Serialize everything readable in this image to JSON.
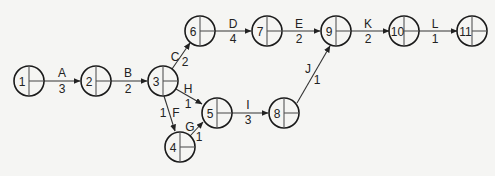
{
  "diagram": {
    "type": "activity-on-arrow network",
    "nodes": [
      {
        "id": "1",
        "label": "1",
        "x": 29,
        "y": 81
      },
      {
        "id": "2",
        "label": "2",
        "x": 96,
        "y": 81
      },
      {
        "id": "3",
        "label": "3",
        "x": 163,
        "y": 81
      },
      {
        "id": "4",
        "label": "4",
        "x": 180,
        "y": 147
      },
      {
        "id": "5",
        "label": "5",
        "x": 217,
        "y": 113
      },
      {
        "id": "6",
        "label": "6",
        "x": 200,
        "y": 31
      },
      {
        "id": "7",
        "label": "7",
        "x": 267,
        "y": 31
      },
      {
        "id": "8",
        "label": "8",
        "x": 284,
        "y": 113
      },
      {
        "id": "9",
        "label": "9",
        "x": 336,
        "y": 31
      },
      {
        "id": "10",
        "label": "10",
        "x": 404,
        "y": 31
      },
      {
        "id": "11",
        "label": "11",
        "x": 472,
        "y": 31
      }
    ],
    "edges": [
      {
        "from": "1",
        "to": "2",
        "activity": "A",
        "duration": "3"
      },
      {
        "from": "2",
        "to": "3",
        "activity": "B",
        "duration": "2"
      },
      {
        "from": "3",
        "to": "6",
        "activity": "C",
        "duration": "2"
      },
      {
        "from": "6",
        "to": "7",
        "activity": "D",
        "duration": "4"
      },
      {
        "from": "7",
        "to": "9",
        "activity": "E",
        "duration": "2"
      },
      {
        "from": "3",
        "to": "4",
        "activity": "F",
        "duration": "1"
      },
      {
        "from": "4",
        "to": "5",
        "activity": "G",
        "duration": "1"
      },
      {
        "from": "3",
        "to": "5",
        "activity": "H",
        "duration": "1"
      },
      {
        "from": "5",
        "to": "8",
        "activity": "I",
        "duration": "3"
      },
      {
        "from": "8",
        "to": "9",
        "activity": "J",
        "duration": "1"
      },
      {
        "from": "9",
        "to": "10",
        "activity": "K",
        "duration": "2"
      },
      {
        "from": "10",
        "to": "11",
        "activity": "L",
        "duration": "1"
      }
    ]
  }
}
